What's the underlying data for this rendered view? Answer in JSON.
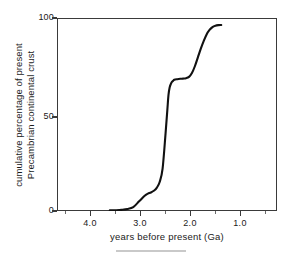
{
  "chart_data": {
    "type": "line",
    "title": "",
    "subtitle": "",
    "xlabel": "years before present (Ga)",
    "ylabel_line1": "cumulative percentage of present",
    "ylabel_line2": "Precambrian continental crust",
    "xlim": [
      4.5,
      0.75
    ],
    "ylim": [
      0,
      100
    ],
    "x_reversed": true,
    "grid": false,
    "legend": null,
    "x_ticks": [
      4.0,
      3.0,
      2.0,
      1.0
    ],
    "x_tick_labels": [
      "4.0",
      "3.0",
      "2.0",
      "1.0"
    ],
    "x_minor_ticks": [
      4.5,
      3.5,
      2.5,
      1.5
    ],
    "y_ticks": [
      0,
      50,
      100
    ],
    "y_tick_labels": [
      "0",
      "50",
      "100"
    ],
    "series": [
      {
        "name": "cumulative Precambrian continental crust",
        "color": "#111111",
        "x": [
          3.6,
          3.5,
          3.4,
          3.3,
          3.2,
          3.1,
          3.0,
          2.95,
          2.9,
          2.85,
          2.8,
          2.75,
          2.7,
          2.65,
          2.62,
          2.6,
          2.58,
          2.55,
          2.52,
          2.5,
          2.45,
          2.4,
          2.35,
          2.3,
          2.25,
          2.2,
          2.15,
          2.1,
          2.05,
          2.0,
          1.95,
          1.9,
          1.85,
          1.8,
          1.75,
          1.7
        ],
        "y": [
          0.3,
          0.4,
          0.6,
          1.0,
          2.0,
          5.0,
          8.0,
          9.0,
          9.6,
          10.5,
          12.0,
          15.0,
          22.0,
          40.0,
          52.0,
          60.0,
          64.0,
          66.5,
          67.5,
          68.0,
          68.3,
          68.5,
          68.6,
          68.8,
          69.5,
          71.5,
          75.0,
          79.5,
          84.0,
          88.0,
          91.5,
          93.8,
          95.3,
          96.0,
          96.3,
          96.4
        ]
      }
    ],
    "annotations": []
  },
  "axes": {
    "y_tick_100": "100",
    "y_tick_50": "50",
    "y_tick_0": "0",
    "x_tick_4": "4.0",
    "x_tick_3": "3.0",
    "x_tick_2": "2.0",
    "x_tick_1": "1.0"
  },
  "colors": {
    "curve": "#111111",
    "frame": "#3a3a3a",
    "text": "#1a1a1a",
    "footer_rule": "#c9c9c9",
    "background": "#ffffff"
  }
}
